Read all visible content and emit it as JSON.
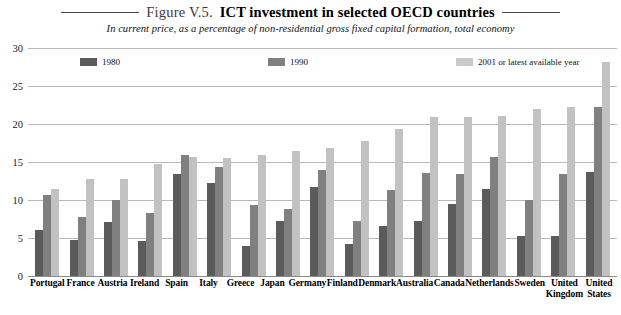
{
  "figure": {
    "label": "Figure V.5.",
    "title": "ICT investment in selected OECD countries",
    "subtitle": "In current price, as a percentage of non-residential gross fixed capital formation, total economy"
  },
  "colors": {
    "series_1980": "#5b5b5b",
    "series_1990": "#808080",
    "series_2001": "#c2c2c2",
    "gridline": "#b9b9b9",
    "axis": "#8a8a8a"
  },
  "chart_data": {
    "type": "bar",
    "title": "ICT investment in selected OECD countries",
    "subtitle": "In current price, as a percentage of non-residential gross fixed capital formation, total economy",
    "xlabel": "",
    "ylabel": "",
    "ylim": [
      0,
      30
    ],
    "yticks": [
      0,
      5,
      10,
      15,
      20,
      25,
      30
    ],
    "grid": true,
    "legend_position": "top-inside",
    "categories": [
      "Portugal",
      "France",
      "Austria",
      "Ireland",
      "Spain",
      "Italy",
      "Greece",
      "Japan",
      "Germany",
      "Finland",
      "Denmark",
      "Australia",
      "Canada",
      "Netherlands",
      "Sweden",
      "United Kingdom",
      "United States"
    ],
    "series": [
      {
        "name": "1980",
        "color": "#5b5b5b",
        "values": [
          6.0,
          4.7,
          7.1,
          4.6,
          13.4,
          12.2,
          4.0,
          7.2,
          11.7,
          4.2,
          6.6,
          7.2,
          9.5,
          11.4,
          5.2,
          5.2,
          13.7
        ]
      },
      {
        "name": "1990",
        "color": "#808080",
        "values": [
          10.7,
          7.8,
          10.0,
          8.3,
          15.9,
          14.3,
          9.3,
          8.8,
          14.0,
          7.2,
          11.3,
          13.6,
          13.4,
          15.7,
          10.0,
          13.4,
          22.2
        ]
      },
      {
        "name": "2001 or latest available year",
        "color": "#c2c2c2",
        "values": [
          11.4,
          12.8,
          12.8,
          14.7,
          15.6,
          15.5,
          15.9,
          16.5,
          16.8,
          17.8,
          19.4,
          20.9,
          20.9,
          21.1,
          22.0,
          22.2,
          28.2
        ]
      }
    ]
  }
}
